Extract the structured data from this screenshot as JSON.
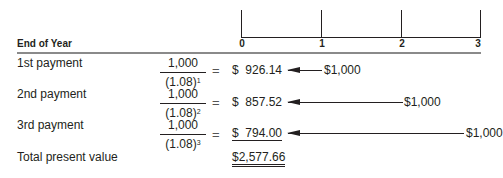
{
  "timeline": {
    "ticks": [
      "0",
      "1",
      "2",
      "3"
    ]
  },
  "header": {
    "label": "End of Year"
  },
  "rows": [
    {
      "label": "1st payment",
      "numerator": "1,000",
      "denominator": "(1.08)",
      "exponent": "1",
      "equals": "=",
      "present_value": "$  926.14",
      "future_amount": "$1,000",
      "year": 1
    },
    {
      "label": "2nd payment",
      "numerator": "1,000",
      "denominator": "(1.08)",
      "exponent": "2",
      "equals": "=",
      "present_value": "$  857.52",
      "future_amount": "$1,000",
      "year": 2
    },
    {
      "label": "3rd payment",
      "numerator": "1,000",
      "denominator": "(1.08)",
      "exponent": "3",
      "equals": "=",
      "present_value": "$  794.00",
      "future_amount": "$1,000",
      "year": 3
    }
  ],
  "total": {
    "label": "Total present value",
    "value": "$2,577.66"
  }
}
